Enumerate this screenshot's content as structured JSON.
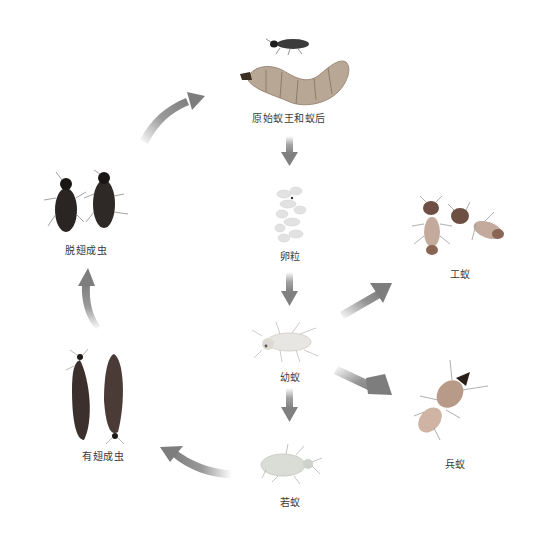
{
  "diagram": {
    "type": "life-cycle",
    "stages": [
      {
        "id": "king_queen",
        "label": "原始蚁王和蚁后",
        "x": 289,
        "y": 116
      },
      {
        "id": "eggs",
        "label": "卵粒",
        "x": 290,
        "y": 254
      },
      {
        "id": "larva",
        "label": "幼蚁",
        "x": 290,
        "y": 375
      },
      {
        "id": "nymph",
        "label": "若蚁",
        "x": 290,
        "y": 500
      },
      {
        "id": "worker",
        "label": "工蚁",
        "x": 460,
        "y": 272
      },
      {
        "id": "soldier",
        "label": "兵蚁",
        "x": 455,
        "y": 462
      },
      {
        "id": "alate",
        "label": "有翅成虫",
        "x": 103,
        "y": 454
      },
      {
        "id": "dealate",
        "label": "脱翅成虫",
        "x": 86,
        "y": 248
      }
    ],
    "arrows": [
      {
        "from": "king_queen",
        "to": "eggs",
        "style": "straight-down"
      },
      {
        "from": "eggs",
        "to": "larva",
        "style": "straight-down"
      },
      {
        "from": "larva",
        "to": "nymph",
        "style": "straight-down"
      },
      {
        "from": "larva",
        "to": "worker",
        "style": "diagonal-up-right"
      },
      {
        "from": "larva",
        "to": "soldier",
        "style": "diagonal-down-right"
      },
      {
        "from": "nymph",
        "to": "alate",
        "style": "curved-left"
      },
      {
        "from": "alate",
        "to": "dealate",
        "style": "curved-up"
      },
      {
        "from": "dealate",
        "to": "king_queen",
        "style": "curved-up-right"
      }
    ],
    "colors": {
      "arrow": "#8a8a8a",
      "label": "#3a3a3a",
      "background": "#ffffff"
    }
  }
}
